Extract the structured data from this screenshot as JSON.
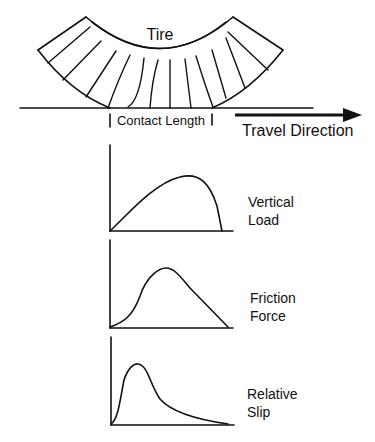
{
  "tire": {
    "label": "Tire",
    "contact_length_label": "Contact Length",
    "travel_direction_label": "Travel Direction"
  },
  "charts": [
    {
      "id": "vertical-load",
      "label_line1": "Vertical",
      "label_line2": "Load",
      "shape": "asymmetric hump peaking at ~65% of contact length, drops steeply to zero before end"
    },
    {
      "id": "friction-force",
      "label_line1": "Friction",
      "label_line2": "Force",
      "shape": "slow rise, peak at ~50%, linear decline to end"
    },
    {
      "id": "relative-slip",
      "label_line1": "Relative",
      "label_line2": "Slip",
      "shape": "sharp early peak at ~20%, long decaying tail"
    }
  ],
  "colors": {
    "ink": "#111111",
    "background": "#ffffff"
  }
}
